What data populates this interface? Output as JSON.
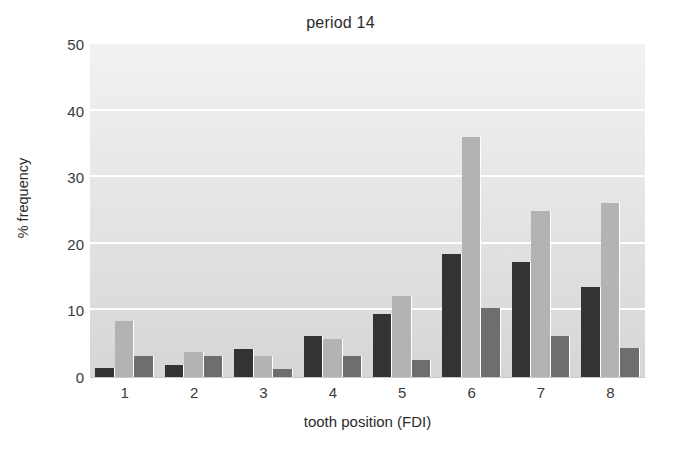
{
  "chart_data": {
    "type": "bar",
    "title": "period 14",
    "xlabel": "tooth position (FDI)",
    "ylabel": "% frequency",
    "categories": [
      "1",
      "2",
      "3",
      "4",
      "5",
      "6",
      "7",
      "8"
    ],
    "yticks": [
      0,
      10,
      20,
      30,
      40,
      50
    ],
    "ylim": [
      0,
      50
    ],
    "xlim_note": "8 grouped categories, 3 bars per group",
    "grid": "horizontal white gridlines at 10, 20, 30, 40",
    "legend": "none",
    "series": [
      {
        "name": "series-1-dark",
        "color": "#333335",
        "values": [
          1.3,
          1.8,
          4.2,
          6.1,
          9.5,
          18.5,
          17.2,
          13.5
        ]
      },
      {
        "name": "series-2-light",
        "color": "#b3b3b3",
        "values": [
          8.4,
          3.8,
          3.1,
          5.7,
          12.1,
          36.0,
          24.9,
          26.2
        ]
      },
      {
        "name": "series-3-medium",
        "color": "#6e6e70",
        "values": [
          3.1,
          3.2,
          1.2,
          3.1,
          2.5,
          10.3,
          6.2,
          4.3
        ]
      }
    ]
  }
}
